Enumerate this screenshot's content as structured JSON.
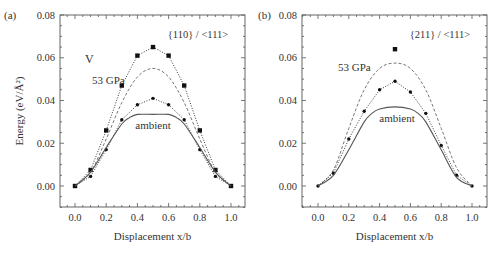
{
  "chart_data": [
    {
      "panel_label": "(a)",
      "type": "line",
      "title": "{110} / <111>",
      "element_label": "V",
      "xlabel": "Displacement x/b",
      "ylabel": "Energy (eV/Å²)",
      "xlim": [
        -0.1,
        1.05
      ],
      "ylim": [
        -0.01,
        0.08
      ],
      "xticks": [
        "0.0",
        "0.2",
        "0.4",
        "0.6",
        "0.8",
        "1.0"
      ],
      "yticks": [
        "0.00",
        "0.02",
        "0.04",
        "0.06",
        "0.08"
      ],
      "annotations": [
        {
          "text": "53 GPa",
          "x": 0.16,
          "y": 0.052
        },
        {
          "text": "ambient",
          "x": 0.5,
          "y": 0.028
        }
      ],
      "series": [
        {
          "name": "53 GPa (calculated, squares)",
          "style": "dotted-square",
          "x": [
            0.0,
            0.1,
            0.2,
            0.3,
            0.4,
            0.5,
            0.6,
            0.7,
            0.8,
            0.9,
            1.0
          ],
          "y": [
            0.0,
            0.0075,
            0.026,
            0.047,
            0.061,
            0.065,
            0.061,
            0.047,
            0.026,
            0.0075,
            0.0
          ]
        },
        {
          "name": "53 GPa (fit, dashed)",
          "style": "dashed",
          "x": [
            0.0,
            0.1,
            0.2,
            0.3,
            0.4,
            0.5,
            0.6,
            0.7,
            0.8,
            0.9,
            1.0
          ],
          "y": [
            0.0,
            0.0065,
            0.022,
            0.039,
            0.051,
            0.055,
            0.051,
            0.039,
            0.022,
            0.0065,
            0.0
          ]
        },
        {
          "name": "ambient (calculated, circles)",
          "style": "dotted-circle",
          "x": [
            0.0,
            0.1,
            0.2,
            0.3,
            0.4,
            0.5,
            0.6,
            0.7,
            0.8,
            0.9,
            1.0
          ],
          "y": [
            0.0,
            0.0045,
            0.017,
            0.031,
            0.038,
            0.041,
            0.038,
            0.031,
            0.017,
            0.0045,
            0.0
          ]
        },
        {
          "name": "ambient (fit, solid)",
          "style": "solid",
          "x": [
            0.0,
            0.1,
            0.2,
            0.3,
            0.35,
            0.4,
            0.5,
            0.6,
            0.65,
            0.7,
            0.8,
            0.9,
            1.0
          ],
          "y": [
            0.0,
            0.0065,
            0.018,
            0.029,
            0.032,
            0.0335,
            0.0335,
            0.0335,
            0.032,
            0.029,
            0.018,
            0.0065,
            0.0
          ]
        }
      ]
    },
    {
      "panel_label": "(b)",
      "type": "line",
      "title": "{211} / <111>",
      "xlabel": "Displacement x/b",
      "ylabel": "",
      "xlim": [
        -0.1,
        1.05
      ],
      "ylim": [
        -0.01,
        0.08
      ],
      "xticks": [
        "0.0",
        "0.2",
        "0.4",
        "0.6",
        "0.8",
        "1.0"
      ],
      "yticks": [
        "0.00",
        "0.02",
        "0.04",
        "0.06",
        "0.08"
      ],
      "annotations": [
        {
          "text": "53 GPa",
          "x": 0.2,
          "y": 0.059
        },
        {
          "text": "ambient",
          "x": 0.5,
          "y": 0.029
        }
      ],
      "series": [
        {
          "name": "53 GPa (calculated, square)",
          "style": "square-only",
          "x": [
            0.5
          ],
          "y": [
            0.064
          ]
        },
        {
          "name": "53 GPa (fit, dashed)",
          "style": "dashed",
          "x": [
            0.0,
            0.1,
            0.2,
            0.3,
            0.4,
            0.5,
            0.6,
            0.7,
            0.8,
            0.9,
            1.0
          ],
          "y": [
            0.0,
            0.0075,
            0.027,
            0.045,
            0.055,
            0.0575,
            0.055,
            0.045,
            0.027,
            0.0085,
            0.0
          ]
        },
        {
          "name": "ambient (calculated, circles)",
          "style": "dotted-circle",
          "x": [
            0.0,
            0.1,
            0.2,
            0.3,
            0.4,
            0.5,
            0.6,
            0.7,
            0.8,
            0.9,
            1.0
          ],
          "y": [
            0.0,
            0.006,
            0.022,
            0.035,
            0.045,
            0.049,
            0.044,
            0.034,
            0.019,
            0.005,
            0.0
          ]
        },
        {
          "name": "ambient (fit, solid)",
          "style": "solid",
          "x": [
            0.0,
            0.1,
            0.2,
            0.3,
            0.35,
            0.4,
            0.5,
            0.6,
            0.65,
            0.7,
            0.8,
            0.9,
            1.0
          ],
          "y": [
            0.0,
            0.005,
            0.017,
            0.03,
            0.034,
            0.036,
            0.037,
            0.036,
            0.034,
            0.03,
            0.017,
            0.004,
            0.0
          ]
        }
      ]
    }
  ],
  "colors": {
    "axis": "#555555",
    "solid": "#555555",
    "dashed": "#777777",
    "dotted": "#222222",
    "marker": "#111111",
    "text": "#333333"
  },
  "layout": {
    "panels": [
      {
        "left": 60,
        "right": 245,
        "top": 15,
        "bottom": 207,
        "x0px": 75,
        "x1px": 231
      },
      {
        "left": 302,
        "right": 487,
        "top": 15,
        "bottom": 207,
        "x0px": 318,
        "x1px": 472
      }
    ]
  }
}
